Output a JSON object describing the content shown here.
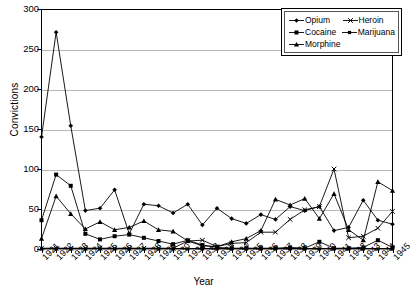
{
  "chart_data": {
    "type": "line",
    "title": "",
    "xlabel": "Year",
    "ylabel": "Convictions",
    "xlim": [
      1921,
      1945
    ],
    "ylim": [
      0,
      300
    ],
    "yticks": [
      0,
      50,
      100,
      150,
      200,
      250,
      300
    ],
    "grid": true,
    "legend_position": "top-right",
    "categories": [
      "1921",
      "1922",
      "1923",
      "1924",
      "1925",
      "1926",
      "1927",
      "1928",
      "1929",
      "1930",
      "1931",
      "1932",
      "1933",
      "1934",
      "1935",
      "1936",
      "1937",
      "1938",
      "1939",
      "1940",
      "1941",
      "1942",
      "1943",
      "1944",
      "1945"
    ],
    "series": [
      {
        "name": "Opium",
        "marker": "diamond",
        "values": [
          140,
          271,
          154,
          48,
          51,
          74,
          19,
          56,
          54,
          45,
          56,
          30,
          51,
          38,
          32,
          43,
          37,
          53,
          48,
          53,
          23,
          27,
          61,
          36,
          31
        ]
      },
      {
        "name": "Cocaine",
        "marker": "square",
        "values": [
          36,
          93,
          79,
          19,
          12,
          16,
          18,
          14,
          10,
          6,
          11,
          5,
          2,
          1,
          1,
          1,
          1,
          2,
          1,
          9,
          1,
          1,
          2,
          11,
          2
        ]
      },
      {
        "name": "Morphine",
        "marker": "triangle",
        "values": [
          13,
          66,
          44,
          25,
          34,
          24,
          27,
          35,
          24,
          22,
          10,
          4,
          3,
          9,
          13,
          23,
          62,
          55,
          63,
          38,
          69,
          24,
          11,
          84,
          73
        ]
      },
      {
        "name": "Heroin",
        "marker": "cross",
        "values": [
          1,
          1,
          1,
          1,
          1,
          1,
          1,
          1,
          1,
          1,
          10,
          11,
          3,
          7,
          8,
          21,
          21,
          37,
          49,
          53,
          100,
          14,
          16,
          26,
          47
        ]
      },
      {
        "name": "Marijuana",
        "marker": "small-square",
        "values": [
          0,
          0,
          0,
          0,
          0,
          0,
          0,
          0,
          0,
          0,
          0,
          0,
          0,
          0,
          0,
          0,
          0,
          0,
          0,
          0,
          0,
          0,
          0,
          0,
          0
        ]
      }
    ]
  },
  "legend": {
    "items": [
      {
        "label": "Opium",
        "marker": "diamond"
      },
      {
        "label": "Heroin",
        "marker": "cross"
      },
      {
        "label": "Cocaine",
        "marker": "square"
      },
      {
        "label": "Marijuana",
        "marker": "small-square"
      },
      {
        "label": "Morphine",
        "marker": "triangle"
      }
    ]
  },
  "colors": {
    "series": "#000000",
    "grid": "#b9b9b9",
    "axis": "#000000",
    "background": "#ffffff"
  }
}
